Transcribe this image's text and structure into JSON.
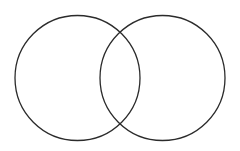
{
  "canvas": {
    "width": 240,
    "height": 151,
    "background_color": "#ffffff",
    "name": "venn-diagram"
  },
  "diagram": {
    "type": "venn",
    "set_count": 2,
    "title": "",
    "labels": [],
    "annotations": [],
    "stroke_color": "#2b2b2b",
    "stroke_width": 1.3,
    "fill": "none",
    "circles": [
      {
        "id": "left-circle",
        "label": "",
        "cx": 77.5,
        "cy": 78,
        "r": 62.5,
        "fill": "none",
        "stroke_color": "#2b2b2b",
        "stroke_width": 1.3
      },
      {
        "id": "right-circle",
        "label": "",
        "cx": 162.5,
        "cy": 78,
        "r": 62.5,
        "fill": "none",
        "stroke_color": "#2b2b2b",
        "stroke_width": 1.3
      }
    ],
    "intersection": {
      "label": "",
      "center_separation": 85,
      "upper_crossing_x": 120,
      "upper_crossing_y": 38,
      "lower_crossing_x": 120,
      "lower_crossing_y": 120
    }
  }
}
